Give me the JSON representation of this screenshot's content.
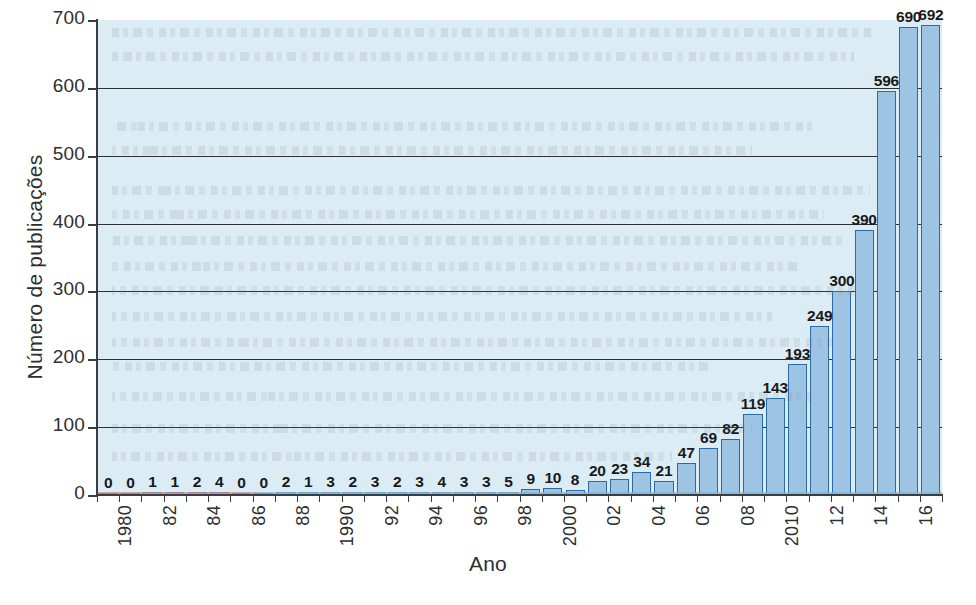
{
  "chart_data": {
    "type": "bar",
    "title": "",
    "xlabel": "Ano",
    "ylabel": "Número de publicações",
    "ylim": [
      0,
      700
    ],
    "ytick_values": [
      0,
      100,
      200,
      300,
      400,
      500,
      600,
      700
    ],
    "ytick_labels": [
      "0",
      "100",
      "200",
      "300",
      "400",
      "500",
      "600",
      "700"
    ],
    "grid": "horizontal",
    "legend": "none",
    "categories": [
      "1980",
      "1981",
      "1982",
      "1983",
      "1984",
      "1985",
      "1986",
      "1987",
      "1988",
      "1989",
      "1990",
      "1991",
      "1992",
      "1993",
      "1994",
      "1995",
      "1996",
      "1997",
      "1998",
      "1999",
      "2000",
      "2001",
      "2002",
      "2003",
      "2004",
      "2005",
      "2006",
      "2007",
      "2008",
      "2009",
      "2010",
      "2011",
      "2012",
      "2013",
      "2014",
      "2015",
      "2016",
      "2017"
    ],
    "values": [
      0,
      0,
      1,
      1,
      2,
      4,
      0,
      0,
      2,
      1,
      3,
      2,
      3,
      2,
      3,
      4,
      3,
      3,
      5,
      9,
      10,
      8,
      20,
      23,
      34,
      21,
      47,
      69,
      82,
      119,
      143,
      193,
      249,
      300,
      390,
      596,
      690,
      692
    ],
    "xtick_labels": [
      {
        "index": 0,
        "text": "1980"
      },
      {
        "index": 2,
        "text": "82"
      },
      {
        "index": 4,
        "text": "84"
      },
      {
        "index": 6,
        "text": "86"
      },
      {
        "index": 8,
        "text": "88"
      },
      {
        "index": 10,
        "text": "1990"
      },
      {
        "index": 12,
        "text": "92"
      },
      {
        "index": 14,
        "text": "94"
      },
      {
        "index": 16,
        "text": "96"
      },
      {
        "index": 18,
        "text": "98"
      },
      {
        "index": 20,
        "text": "2000"
      },
      {
        "index": 22,
        "text": "02"
      },
      {
        "index": 24,
        "text": "04"
      },
      {
        "index": 26,
        "text": "06"
      },
      {
        "index": 28,
        "text": "08"
      },
      {
        "index": 30,
        "text": "2010"
      },
      {
        "index": 32,
        "text": "12"
      },
      {
        "index": 34,
        "text": "14"
      },
      {
        "index": 36,
        "text": "16"
      }
    ],
    "colors": {
      "plot_background": "#dcecf4",
      "bar_fill": "#9ec4e4",
      "bar_stroke": "#2a6aa8",
      "axis": "#3a3c3d",
      "gridline": "#2f3132",
      "text": "#2d2f30",
      "value_label": "#18191a",
      "page_background": "#ffffff"
    }
  }
}
